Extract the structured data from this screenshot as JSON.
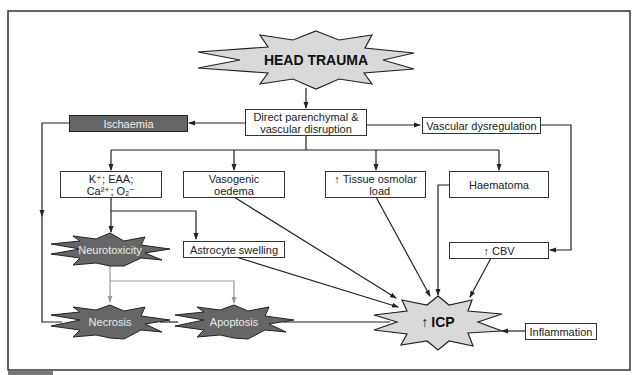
{
  "diagram": {
    "colors": {
      "frame": "#333333",
      "light_star_fill": "#d9d9d9",
      "dark_fill": "#666666",
      "grey_arrow": "#9a9a9a",
      "box_fill": "#ffffff"
    },
    "nodes": {
      "head_trauma": {
        "label": "HEAD TRAUMA",
        "shape": "star-light"
      },
      "direct_disruption": {
        "label": "Direct parenchymal &\nvascular disruption",
        "shape": "box"
      },
      "ischaemia": {
        "label": "Ischaemia",
        "shape": "box-dark"
      },
      "vascular_dysregulation": {
        "label": "Vascular dysregulation",
        "shape": "box"
      },
      "ions": {
        "label_line1": "K⁺; EAA;",
        "label_line2": "Ca²⁺; O₂⁻",
        "shape": "box"
      },
      "vasogenic_oedema": {
        "label": "Vasogenic\noedema",
        "shape": "box"
      },
      "tissue_osmolar": {
        "arrow": "↑",
        "label": "Tissue osmolar\nload",
        "shape": "box"
      },
      "haematoma": {
        "label": "Haematoma",
        "shape": "box"
      },
      "neurotoxicity": {
        "label": "Neurotoxicity",
        "shape": "star-dark"
      },
      "astrocyte_swelling": {
        "label": "Astrocyte swelling",
        "shape": "box"
      },
      "cbv": {
        "arrow": "↑",
        "label": "CBV",
        "shape": "box"
      },
      "necrosis": {
        "label": "Necrosis",
        "shape": "star-dark"
      },
      "apoptosis": {
        "label": "Apoptosis",
        "shape": "star-dark"
      },
      "icp": {
        "arrow": "↑",
        "label": "ICP",
        "shape": "star-light"
      },
      "inflammation": {
        "label": "Inflammation",
        "shape": "box"
      }
    },
    "edges": [
      [
        "head_trauma",
        "direct_disruption"
      ],
      [
        "direct_disruption",
        "ischaemia"
      ],
      [
        "direct_disruption",
        "vascular_dysregulation"
      ],
      [
        "direct_disruption",
        "ions"
      ],
      [
        "direct_disruption",
        "vasogenic_oedema"
      ],
      [
        "direct_disruption",
        "tissue_osmolar"
      ],
      [
        "direct_disruption",
        "haematoma"
      ],
      [
        "ischaemia",
        "necrosis"
      ],
      [
        "vascular_dysregulation",
        "cbv"
      ],
      [
        "ions",
        "neurotoxicity"
      ],
      [
        "ions",
        "astrocyte_swelling"
      ],
      [
        "neurotoxicity",
        "necrosis"
      ],
      [
        "neurotoxicity",
        "apoptosis"
      ],
      [
        "vasogenic_oedema",
        "icp"
      ],
      [
        "astrocyte_swelling",
        "icp"
      ],
      [
        "tissue_osmolar",
        "icp"
      ],
      [
        "haematoma",
        "icp"
      ],
      [
        "cbv",
        "icp"
      ],
      [
        "inflammation",
        "icp"
      ],
      [
        "necrosis",
        "apoptosis"
      ],
      [
        "apoptosis",
        "icp"
      ]
    ]
  }
}
